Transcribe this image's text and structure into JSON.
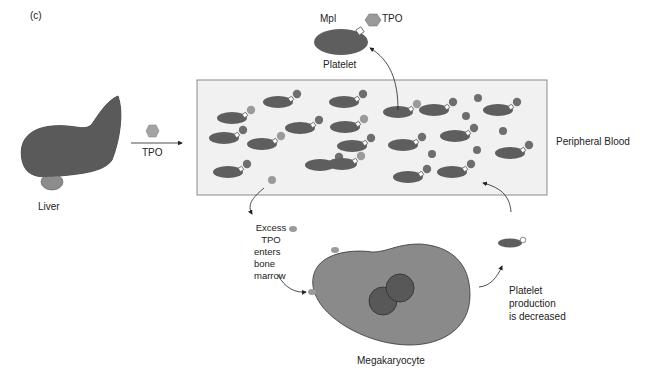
{
  "figure": {
    "panel_label": "(c)",
    "colors": {
      "background": "#ffffff",
      "blood_box_fill": "#f1f1f1",
      "blood_box_border": "#8a8a8a",
      "liver": "#5a5a5a",
      "liver_lobe": "#8c8c8c",
      "platelet": "#5e5e5e",
      "tpo": "#9a9a9a",
      "tpo_bound": "#7a7a7a",
      "megakaryocyte": "#8a8a8a",
      "nucleus": "#585858",
      "text": "#222222"
    }
  },
  "liver": {
    "label": "Liver"
  },
  "secretion": {
    "label": "TPO"
  },
  "top_detail": {
    "receptor_label": "Mpl",
    "ligand_label": "TPO",
    "cell_label": "Platelet"
  },
  "blood": {
    "label": "Peripheral Blood"
  },
  "marrow": {
    "excess_label": [
      "Excess",
      "TPO",
      "enters",
      "bone",
      "marrow"
    ],
    "cell_label": "Megakaryocyte",
    "outcome_label": [
      "Platelet",
      "production",
      "is decreased"
    ]
  }
}
